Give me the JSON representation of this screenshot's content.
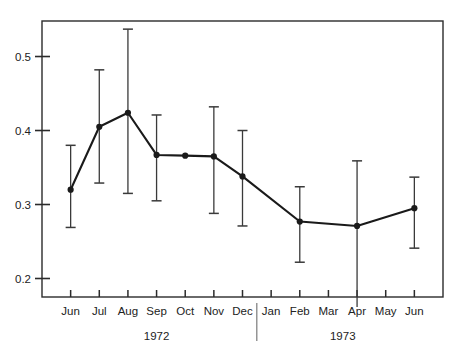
{
  "chart_data": {
    "type": "line",
    "title": "",
    "subtitle": "",
    "xlabel": "",
    "ylabel": "",
    "grid": false,
    "legend": null,
    "error_bars": true,
    "xlim": [
      0,
      13
    ],
    "ylim": [
      0.175,
      0.548
    ],
    "ytick_labels": [
      "0.5",
      "0.4",
      "0.3",
      "0.2"
    ],
    "ytick_values": [
      0.5,
      0.4,
      0.3,
      0.2
    ],
    "categories": [
      "Jun",
      "Jul",
      "Aug",
      "Sep",
      "Oct",
      "Nov",
      "Dec",
      "Jan",
      "Feb",
      "Mar",
      "Apr",
      "May",
      "Jun"
    ],
    "group_labels": [
      "1972",
      "1973"
    ],
    "group_divider_after": "Dec",
    "series": [
      {
        "name": "",
        "points": [
          {
            "x": "Jun",
            "year": "1972",
            "value": 0.32,
            "low": 0.269,
            "high": 0.38
          },
          {
            "x": "Jul",
            "year": "1972",
            "value": 0.405,
            "low": 0.329,
            "high": 0.482
          },
          {
            "x": "Aug",
            "year": "1972",
            "value": 0.424,
            "low": 0.315,
            "high": 0.537
          },
          {
            "x": "Sep",
            "year": "1972",
            "value": 0.367,
            "low": 0.305,
            "high": 0.421
          },
          {
            "x": "Oct",
            "year": "1972",
            "value": 0.366,
            "low": null,
            "high": null
          },
          {
            "x": "Nov",
            "year": "1972",
            "value": 0.365,
            "low": 0.288,
            "high": 0.432
          },
          {
            "x": "Dec",
            "year": "1972",
            "value": 0.338,
            "low": 0.271,
            "high": 0.4
          },
          {
            "x": "Feb",
            "year": "1973",
            "value": 0.277,
            "low": 0.222,
            "high": 0.324
          },
          {
            "x": "Apr",
            "year": "1973",
            "value": 0.271,
            "low": 0.172,
            "high": 0.359
          },
          {
            "x": "Jun",
            "year": "1973",
            "value": 0.295,
            "low": 0.241,
            "high": 0.337
          }
        ]
      }
    ]
  },
  "style": {
    "line_color": "#1a1a1a",
    "marker_color": "#1a1a1a",
    "error_bar_color": "#3a3a3a",
    "frame_color": "#2b2b2b",
    "background": "#ffffff"
  }
}
